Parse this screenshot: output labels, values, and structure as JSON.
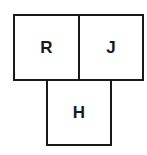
{
  "diagram": {
    "boxes": [
      {
        "id": "R",
        "label": "R",
        "position": "top-left"
      },
      {
        "id": "J",
        "label": "J",
        "position": "top-right"
      },
      {
        "id": "H",
        "label": "H",
        "position": "bottom-center"
      }
    ]
  }
}
